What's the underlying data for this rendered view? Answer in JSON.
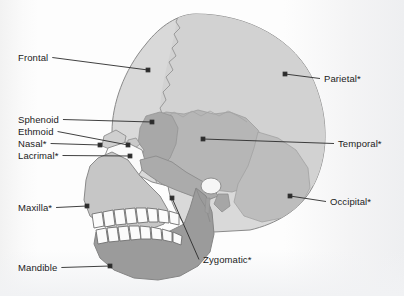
{
  "figure": {
    "type": "anatomical-diagram",
    "footnote_marker": "*",
    "background_color": "#fdfdfd",
    "leader_color": "#2b2b2b",
    "text_color": "#1b1b1b"
  },
  "palette": {
    "frontal": "#d9d9d9",
    "parietal": "#d2d2d2",
    "temporal": "#b6b6b6",
    "occipital": "#bdbdbd",
    "sphenoid": "#a8a8a8",
    "ethmoid": "#c9c9c9",
    "nasal": "#cfcfcf",
    "lacrimal": "#e2e2e2",
    "maxilla": "#c6c6c6",
    "zygomatic": "#ababab",
    "mandible": "#9b9b9b",
    "teeth": "#fbfbfb",
    "outline": "#8a8a8a"
  },
  "labels": [
    {
      "id": "frontal",
      "text": "Frontal",
      "side": "left",
      "x": 18,
      "y": 52,
      "dot_x": 148,
      "dot_y": 70
    },
    {
      "id": "sphenoid",
      "text": "Sphenoid",
      "side": "left",
      "x": 18,
      "y": 114,
      "dot_x": 152,
      "dot_y": 122
    },
    {
      "id": "ethmoid",
      "text": "Ethmoid",
      "side": "left",
      "x": 18,
      "y": 126,
      "dot_x": 128,
      "dot_y": 145
    },
    {
      "id": "nasal",
      "text": "Nasal*",
      "side": "left",
      "x": 18,
      "y": 138,
      "dot_x": 100,
      "dot_y": 145
    },
    {
      "id": "lacrimal",
      "text": "Lacrimal*",
      "side": "left",
      "x": 18,
      "y": 150,
      "dot_x": 130,
      "dot_y": 156
    },
    {
      "id": "maxilla",
      "text": "Maxilla*",
      "side": "left",
      "x": 18,
      "y": 202,
      "dot_x": 87,
      "dot_y": 206
    },
    {
      "id": "mandible",
      "text": "Mandible",
      "side": "left",
      "x": 18,
      "y": 262,
      "dot_x": 110,
      "dot_y": 266
    },
    {
      "id": "parietal",
      "text": "Parietal*",
      "side": "right",
      "x": 324,
      "y": 73,
      "dot_x": 285,
      "dot_y": 74
    },
    {
      "id": "temporal",
      "text": "Temporal*",
      "side": "right",
      "x": 338,
      "y": 138,
      "dot_x": 203,
      "dot_y": 139
    },
    {
      "id": "occipital",
      "text": "Occipital*",
      "side": "right",
      "x": 330,
      "y": 196,
      "dot_x": 290,
      "dot_y": 196
    },
    {
      "id": "zygomatic",
      "text": "Zygomatic*",
      "side": "right",
      "x": 203,
      "y": 254,
      "dot_x": 172,
      "dot_y": 198
    }
  ]
}
